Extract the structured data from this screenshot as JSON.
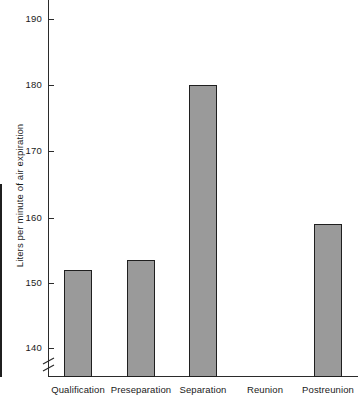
{
  "chart_data": {
    "type": "bar",
    "title": "",
    "xlabel": "",
    "ylabel": "Liters per minute of air expiration",
    "categories": [
      "Qualification",
      "Preseparation",
      "Separation",
      "Reunion",
      "Postreunion"
    ],
    "values": [
      152,
      153.5,
      180,
      165,
      159
    ],
    "ylim": [
      136,
      193
    ],
    "yticks": [
      140,
      150,
      160,
      170,
      180,
      190
    ],
    "ytick_labels": [
      "140",
      "150",
      "160",
      "170",
      "180",
      "190"
    ],
    "axis_break": true,
    "axis_break_position": "below-140",
    "grid": false,
    "legend": null,
    "bar_fill_color": "#9a9a9a",
    "bar_edge_color": "#1f1f1f",
    "axis_color": "#2b2b2b",
    "background_color": "#ffffff"
  }
}
